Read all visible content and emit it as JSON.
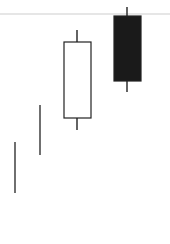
{
  "chart_data": {
    "type": "candlestick",
    "title": "",
    "xlabel": "",
    "ylabel": "",
    "grid": false,
    "reference_line": {
      "y_px": 14,
      "color": "#e6e6e6"
    },
    "candles": [
      {
        "index": 1,
        "style": "line",
        "x_px": 15,
        "high_px": 142,
        "low_px": 193,
        "color": "#333333"
      },
      {
        "index": 2,
        "style": "line",
        "x_px": 40,
        "high_px": 105,
        "low_px": 155,
        "color": "#333333"
      },
      {
        "index": 3,
        "style": "bullish",
        "x_center_px": 77,
        "body_left_px": 64,
        "body_right_px": 91,
        "open_px": 118,
        "close_px": 42,
        "high_px": 30,
        "low_px": 130,
        "fill": "#ffffff",
        "stroke": "#222222"
      },
      {
        "index": 4,
        "style": "bearish",
        "x_center_px": 127,
        "body_left_px": 114,
        "body_right_px": 141,
        "open_px": 16,
        "close_px": 81,
        "high_px": 7,
        "low_px": 92,
        "fill": "#1a1a1a",
        "stroke": "#222222"
      }
    ]
  }
}
